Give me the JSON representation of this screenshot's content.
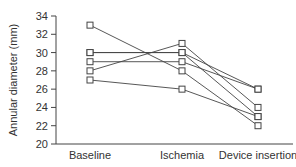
{
  "chart_data": {
    "type": "line",
    "title": "",
    "xlabel": "",
    "ylabel": "Annular diameter (mm)",
    "categories": [
      "Baseline",
      "Ischemia",
      "Device insertion"
    ],
    "ylim": [
      20,
      34
    ],
    "yticks": [
      20,
      22,
      24,
      26,
      28,
      30,
      32,
      34
    ],
    "grid": false,
    "legend": null,
    "marker": "open-square",
    "series": [
      {
        "name": "Subject 1",
        "values": [
          33,
          28,
          22
        ]
      },
      {
        "name": "Subject 2",
        "values": [
          28,
          31,
          24
        ]
      },
      {
        "name": "Subject 3",
        "values": [
          30,
          30,
          26
        ]
      },
      {
        "name": "Subject 4",
        "values": [
          30,
          30,
          23
        ]
      },
      {
        "name": "Subject 5",
        "values": [
          29,
          29,
          26
        ]
      },
      {
        "name": "Subject 6",
        "values": [
          27,
          26,
          23
        ]
      }
    ]
  },
  "colors": {
    "line": "#444444",
    "axis": "#444444",
    "marker_fill": "#ffffff"
  }
}
